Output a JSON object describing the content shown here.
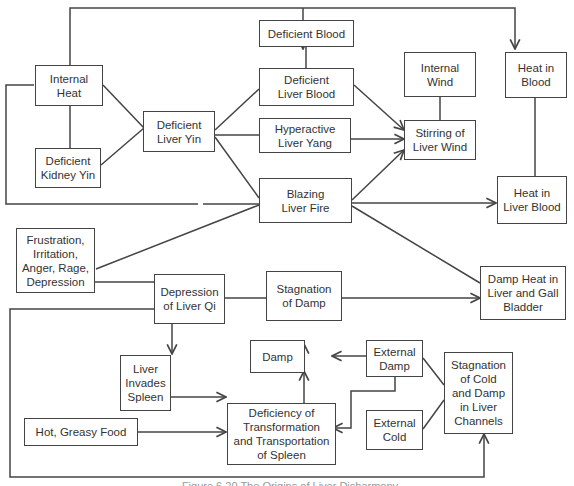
{
  "diagram": {
    "nodes": {
      "internal_heat": "Internal\nHeat",
      "deficient_kidney_yin": "Deficient\nKidney Yin",
      "deficient_liver_yin": "Deficient\nLiver Yin",
      "deficient_blood": "Deficient Blood",
      "deficient_liver_blood": "Deficient\nLiver Blood",
      "hyperactive_liver_yang": "Hyperactive\nLiver Yang",
      "blazing_liver_fire": "Blazing\nLiver Fire",
      "internal_wind": "Internal\nWind",
      "stirring_of_liver_wind": "Stirring of\nLiver Wind",
      "heat_in_blood": "Heat in\nBlood",
      "heat_in_liver_blood": "Heat in\nLiver Blood",
      "frustration": "Frustration,\nIrritation,\nAnger, Rage,\nDepression",
      "depression_of_liver_qi": "Depression\nof Liver Qi",
      "stagnation_of_damp": "Stagnation\nof Damp",
      "damp_heat": "Damp Heat in\nLiver and Gall\nBladder",
      "damp": "Damp",
      "liver_invades_spleen": "Liver\nInvades\nSpleen",
      "external_damp": "External\nDamp",
      "external_cold": "External\nCold",
      "stagnation_cold_damp": "Stagnation\nof Cold\nand Damp\nin Liver\nChannels",
      "hot_greasy_food": "Hot, Greasy Food",
      "deficiency_transformation": "Deficiency of\nTransformation\nand Transportation\nof Spleen"
    },
    "edges": [
      [
        "internal_heat",
        "deficient_liver_yin"
      ],
      [
        "deficient_kidney_yin",
        "deficient_liver_yin"
      ],
      [
        "internal_heat",
        "deficient_kidney_yin"
      ],
      [
        "deficient_liver_yin",
        "deficient_liver_blood"
      ],
      [
        "deficient_liver_yin",
        "hyperactive_liver_yang"
      ],
      [
        "deficient_liver_yin",
        "blazing_liver_fire"
      ],
      [
        "deficient_blood",
        "deficient_liver_blood"
      ],
      [
        "deficient_liver_blood",
        "stirring_of_liver_wind"
      ],
      [
        "hyperactive_liver_yang",
        "stirring_of_liver_wind"
      ],
      [
        "blazing_liver_fire",
        "stirring_of_liver_wind"
      ],
      [
        "internal_wind",
        "stirring_of_liver_wind"
      ],
      [
        "internal_heat",
        "internal_wind"
      ],
      [
        "internal_heat",
        "heat_in_blood"
      ],
      [
        "heat_in_blood",
        "heat_in_liver_blood"
      ],
      [
        "blazing_liver_fire",
        "heat_in_liver_blood"
      ],
      [
        "internal_heat",
        "blazing_liver_fire"
      ],
      [
        "blazing_liver_fire",
        "damp_heat"
      ],
      [
        "frustration",
        "blazing_liver_fire"
      ],
      [
        "frustration",
        "depression_of_liver_qi"
      ],
      [
        "depression_of_liver_qi",
        "stagnation_of_damp"
      ],
      [
        "stagnation_of_damp",
        "damp_heat"
      ],
      [
        "depression_of_liver_qi",
        "liver_invades_spleen"
      ],
      [
        "depression_of_liver_qi",
        "stagnation_cold_damp"
      ],
      [
        "damp",
        "stagnation_of_damp"
      ],
      [
        "external_damp",
        "damp"
      ],
      [
        "external_damp",
        "deficiency_transformation"
      ],
      [
        "external_damp",
        "stagnation_cold_damp"
      ],
      [
        "external_cold",
        "stagnation_cold_damp"
      ],
      [
        "liver_invades_spleen",
        "deficiency_transformation"
      ],
      [
        "hot_greasy_food",
        "deficiency_transformation"
      ],
      [
        "deficiency_transformation",
        "damp"
      ]
    ]
  },
  "caption": "Figure 6.20 The Origins of Liver Disharmony"
}
